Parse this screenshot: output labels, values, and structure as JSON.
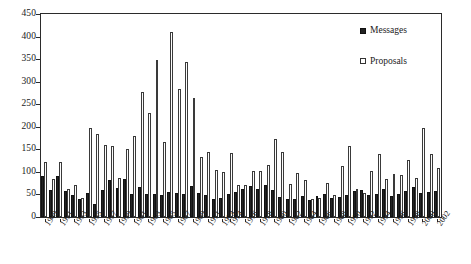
{
  "chart_data": {
    "type": "bar",
    "title": "",
    "subtitle": "",
    "xlabel": "",
    "ylabel": "",
    "ylim": [
      0,
      450
    ],
    "ytick_step": 50,
    "yticks": [
      0,
      50,
      100,
      150,
      200,
      250,
      300,
      350,
      400,
      450
    ],
    "grid": false,
    "legend_position": "top-right",
    "legend": [
      "Messages",
      "Proposals"
    ],
    "colors": {
      "messages": "#222222",
      "proposals": "#fdfdfd",
      "proposals_border": "#3a3a3a",
      "axis": "#2b2b2b",
      "text": "#1a1a1a",
      "background": "#ffffff"
    },
    "categories": [
      "1949",
      "1950",
      "1951",
      "1952",
      "1953",
      "1954",
      "1955",
      "1956",
      "1957",
      "1958",
      "1959",
      "1960",
      "1961",
      "1962",
      "1963",
      "1964",
      "1965",
      "1966",
      "1967",
      "1968",
      "1969",
      "1970",
      "1971",
      "1972",
      "1973",
      "1974",
      "1975",
      "1976",
      "1977",
      "1978",
      "1979",
      "1980",
      "1981",
      "1982",
      "1983",
      "1984",
      "1985",
      "1986",
      "1987",
      "1988",
      "1989",
      "1990",
      "1991",
      "1992",
      "1993",
      "1994",
      "1995",
      "1996",
      "1997",
      "1998",
      "1999",
      "2000",
      "2001",
      "2002"
    ],
    "xtick_labels": [
      "1949",
      "1951",
      "1953",
      "1955",
      "1957",
      "1959",
      "1961",
      "1963",
      "1965",
      "1967",
      "1969",
      "1971",
      "1973",
      "1974",
      "1976",
      "1978",
      "1980",
      "1982",
      "1984",
      "1986",
      "1988",
      "1990",
      "1992",
      "1994",
      "1996",
      "1998",
      "2000",
      "2002"
    ],
    "series": [
      {
        "name": "Messages",
        "values": [
          90,
          60,
          91,
          57,
          49,
          40,
          54,
          29,
          60,
          82,
          65,
          85,
          52,
          66,
          52,
          51,
          49,
          55,
          53,
          50,
          68,
          54,
          48,
          40,
          43,
          51,
          56,
          63,
          69,
          62,
          72,
          60,
          44,
          39,
          41,
          47,
          37,
          46,
          52,
          42,
          45,
          49,
          57,
          59,
          48,
          52,
          62,
          47,
          52,
          58,
          66,
          53,
          55,
          58
        ]
      },
      {
        "name": "Proposals",
        "values": [
          123,
          85,
          123,
          63,
          72,
          43,
          197,
          183,
          159,
          158,
          86,
          151,
          179,
          277,
          231,
          348,
          167,
          410,
          284,
          344,
          263,
          134,
          145,
          105,
          99,
          142,
          72,
          70,
          102,
          103,
          116,
          172,
          144,
          73,
          97,
          82,
          41,
          42,
          76,
          48,
          113,
          157,
          62,
          53,
          101,
          140,
          84,
          96,
          93,
          126,
          86,
          197,
          139,
          108
        ]
      }
    ]
  }
}
